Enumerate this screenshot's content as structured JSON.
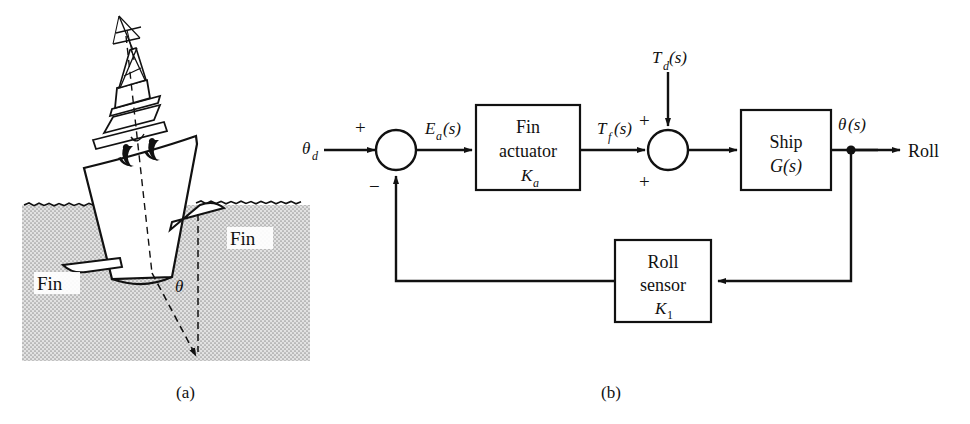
{
  "figure": {
    "panel_a": {
      "caption": "(a)",
      "labels": {
        "fin_left": "Fin",
        "fin_right": "Fin",
        "roll_angle": "θ"
      },
      "description": "Ship rolling at angle theta with stabilizer fins below waterline"
    },
    "panel_b": {
      "caption": "(b)",
      "inputs": {
        "reference": "θ",
        "reference_sub": "d",
        "disturbance_main": "T",
        "disturbance_sub": "d",
        "disturbance_arg": "(s)"
      },
      "signals": {
        "error_main": "E",
        "error_sub": "a",
        "error_arg": "(s)",
        "fin_torque_main": "T",
        "fin_torque_sub": "f",
        "fin_torque_arg": "(s)",
        "output_main": "θ",
        "output_arg": "(s)",
        "output_label": "Roll"
      },
      "summing_junctions": [
        {
          "name": "error-junction",
          "signs": {
            "top": "+",
            "bottom": "−"
          }
        },
        {
          "name": "disturbance-junction",
          "signs": {
            "top": "+",
            "bottom": "+"
          }
        }
      ],
      "blocks": [
        {
          "name": "fin-actuator",
          "line1": "Fin",
          "line2": "actuator",
          "gain_main": "K",
          "gain_sub": "a"
        },
        {
          "name": "ship",
          "line1": "Ship",
          "line2": "G(s)",
          "gain_main": "",
          "gain_sub": ""
        },
        {
          "name": "roll-sensor",
          "line1": "Roll",
          "line2": "sensor",
          "gain_main": "K",
          "gain_sub": "1"
        }
      ]
    }
  },
  "colors": {
    "ink": "#111111",
    "water_fill": "#d8d8d8",
    "paper": "#ffffff"
  }
}
